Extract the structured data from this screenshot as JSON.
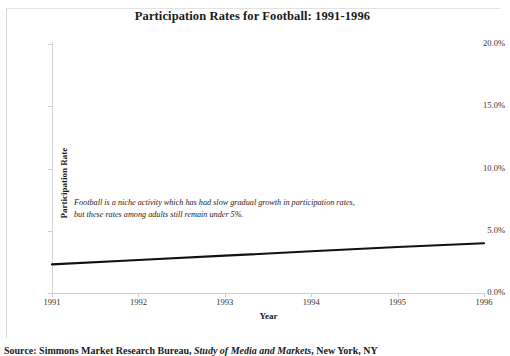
{
  "chart_data": {
    "type": "line",
    "title": "Participation Rates for Football: 1991-1996",
    "xlabel": "Year",
    "ylabel": "Participation Rate",
    "x": [
      1991,
      1992,
      1993,
      1994,
      1995,
      1996
    ],
    "xtick_labels": [
      "1991",
      "1992",
      "1993",
      "1994",
      "1995",
      "1996"
    ],
    "ytick_labels": [
      "0.0%",
      "5.0%",
      "10.0%",
      "15.0%",
      "20.0%"
    ],
    "ytick_values": [
      0,
      5,
      10,
      15,
      20
    ],
    "ylim": [
      0,
      20
    ],
    "xlim": [
      1991,
      1996
    ],
    "grid": false,
    "legend": "none",
    "series": [
      {
        "name": "Football participation rate",
        "color": "#111111",
        "values": [
          2.3,
          2.65,
          3.0,
          3.35,
          3.7,
          4.0
        ]
      }
    ],
    "annotations": [
      {
        "name": "chart-annotation",
        "text": "Football is a niche activity which has had slow gradual growth in participation rates, but these rates among adults still remain under 5%."
      }
    ]
  },
  "source": {
    "prefix": "Source: Simmons Market Research Bureau,",
    "italic_title": "Study of Media and Markets",
    "suffix": ", New York, NY"
  }
}
